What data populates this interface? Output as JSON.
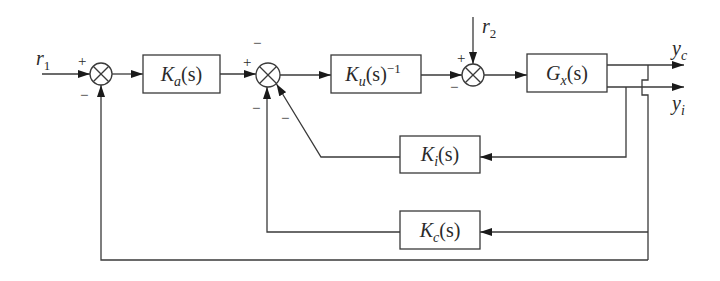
{
  "diagram": {
    "title": "",
    "type": "control block diagram",
    "signals": {
      "r1": {
        "main": "r",
        "sub": "1"
      },
      "r2": {
        "main": "r",
        "sub": "2"
      },
      "yc": {
        "main": "y",
        "sub": "c"
      },
      "yi": {
        "main": "y",
        "sub": "i"
      }
    },
    "blocks": {
      "Ka": {
        "main": "K",
        "sub": "a",
        "tail": "(s)"
      },
      "Ku": {
        "main": "K",
        "sub": "u",
        "tail": "(s)",
        "sup": "−1"
      },
      "Gx": {
        "main": "G",
        "sub": "x",
        "tail": "(s)"
      },
      "Ki": {
        "main": "K",
        "sub": "i",
        "tail": "(s)"
      },
      "Kc": {
        "main": "K",
        "sub": "c",
        "tail": "(s)"
      }
    },
    "signs": {
      "j1_in": "+",
      "j1_fb": "−",
      "j2_in": "+",
      "j2_top": "−",
      "j2_fb_c": "−",
      "j2_fb_i": "−",
      "j3_in": "−",
      "j3_r2": "+"
    },
    "colors": {
      "line": "#3a3a3a",
      "arrow": "#1a1a1a",
      "background": "#ffffff"
    }
  }
}
